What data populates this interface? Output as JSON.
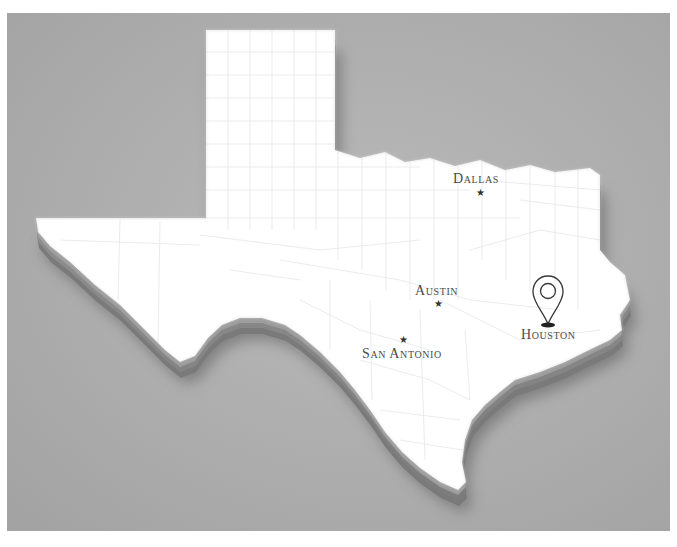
{
  "image": {
    "subject": "3D relief map of Texas with county boundaries",
    "background_color": "#adadad",
    "land_color": "#ffffff",
    "extrusion_color": "#8d8d8d",
    "label_color": "#4a4a4a"
  },
  "cities": [
    {
      "name": "Dallas",
      "marker": "star-icon"
    },
    {
      "name": "Austin",
      "marker": "star-icon"
    },
    {
      "name": "San Antonio",
      "marker": "star-icon"
    },
    {
      "name": "Houston",
      "marker": "location-pin-icon"
    }
  ],
  "markers": {
    "star_glyph": "★"
  }
}
